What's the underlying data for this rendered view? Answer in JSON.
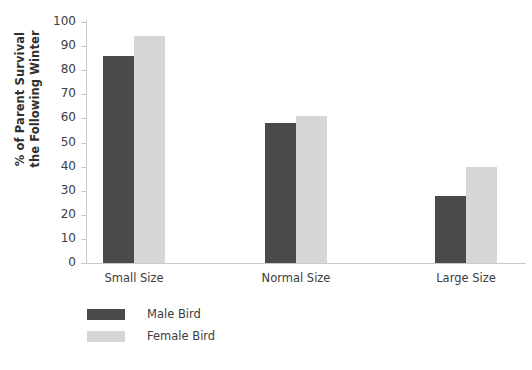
{
  "chart_data": {
    "type": "bar",
    "title": "",
    "xlabel": "",
    "ylabel": "% of Parent Survival the Following Winter",
    "ylabel_lines": [
      "% of Parent Survival",
      "the Following Winter"
    ],
    "categories": [
      "Small Size",
      "Normal Size",
      "Large Size"
    ],
    "series": [
      {
        "name": "Male Bird",
        "color": "#4a4a4a",
        "values": [
          86,
          58,
          28
        ]
      },
      {
        "name": "Female Bird",
        "color": "#d6d6d6",
        "values": [
          94,
          61,
          40
        ]
      }
    ],
    "ylim": [
      0,
      100
    ],
    "ytick_step": 10,
    "yticks": [
      100,
      90,
      80,
      70,
      60,
      50,
      40,
      30,
      20,
      10,
      0
    ],
    "grid": false,
    "legend_position": "bottom-left",
    "axis_color": "#c9c9c9"
  },
  "legend": {
    "entries": [
      {
        "label": "Male Bird",
        "color": "#4a4a4a"
      },
      {
        "label": "Female Bird",
        "color": "#d6d6d6"
      }
    ]
  }
}
